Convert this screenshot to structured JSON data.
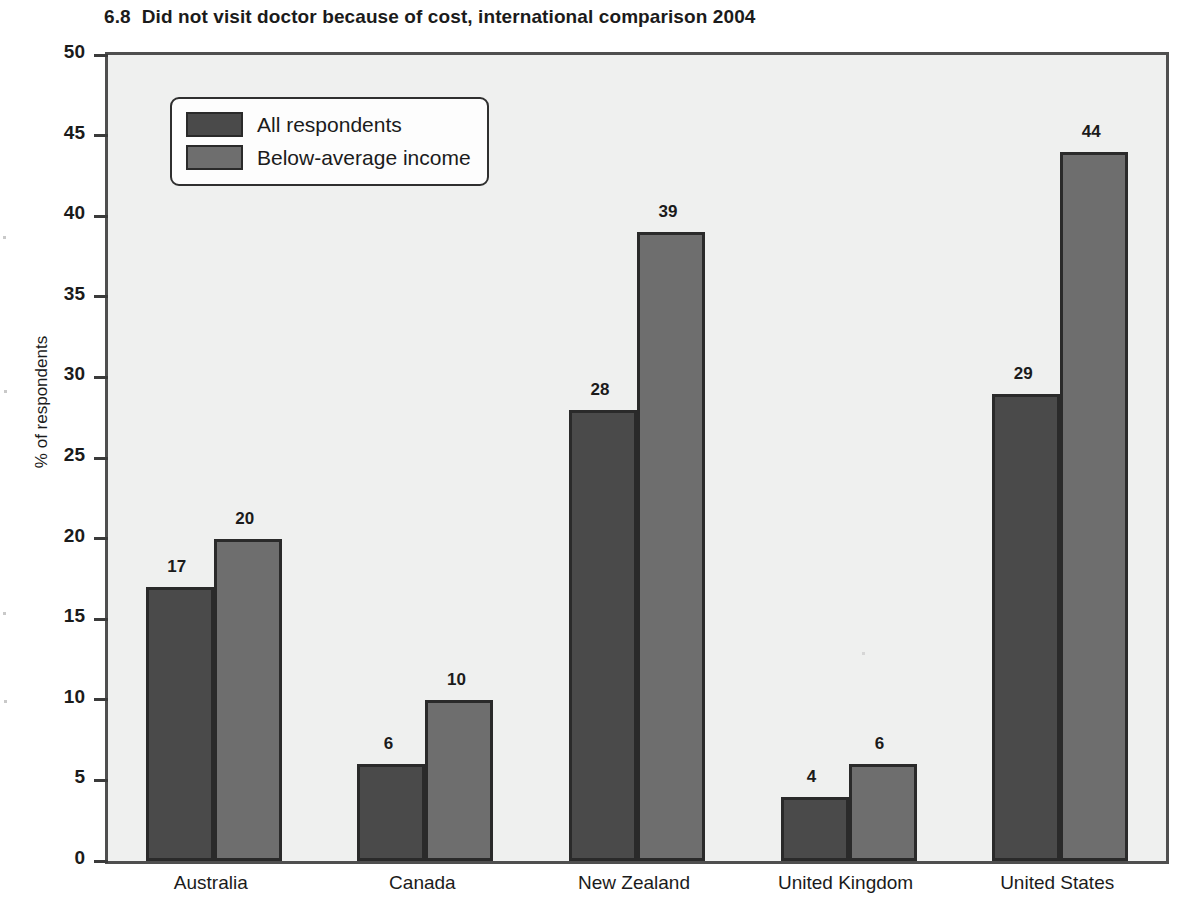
{
  "figure": {
    "number": "6.8",
    "title": "Did not visit doctor because of cost, international comparison 2004"
  },
  "chart_data": {
    "type": "bar",
    "title": "Did not visit doctor because of cost, international comparison 2004",
    "xlabel": "",
    "ylabel": "% of respondents",
    "ylim": [
      0,
      50
    ],
    "ytick_step": 5,
    "yticks": [
      "0",
      "5",
      "10",
      "15",
      "20",
      "25",
      "30",
      "35",
      "40",
      "45",
      "50"
    ],
    "grid": false,
    "legend_position": "upper-left",
    "categories": [
      "Australia",
      "Canada",
      "New Zealand",
      "United Kingdom",
      "United States"
    ],
    "series": [
      {
        "name": "All respondents",
        "color": "#4a4a4a",
        "values": [
          17,
          6,
          28,
          4,
          29
        ],
        "labels": [
          "17",
          "6",
          "28",
          "4",
          "29"
        ]
      },
      {
        "name": "Below-average income",
        "color": "#6e6e6e",
        "values": [
          20,
          10,
          39,
          6,
          44
        ],
        "labels": [
          "20",
          "10",
          "39",
          "6",
          "44"
        ]
      }
    ]
  },
  "colors": {
    "plot_background": "#eff0ef",
    "frame": "#4f4f4f",
    "bar_outline": "#2a2a2a",
    "text": "#1b1b1b",
    "series_0": "#4a4a4a",
    "series_1": "#6e6e6e"
  }
}
